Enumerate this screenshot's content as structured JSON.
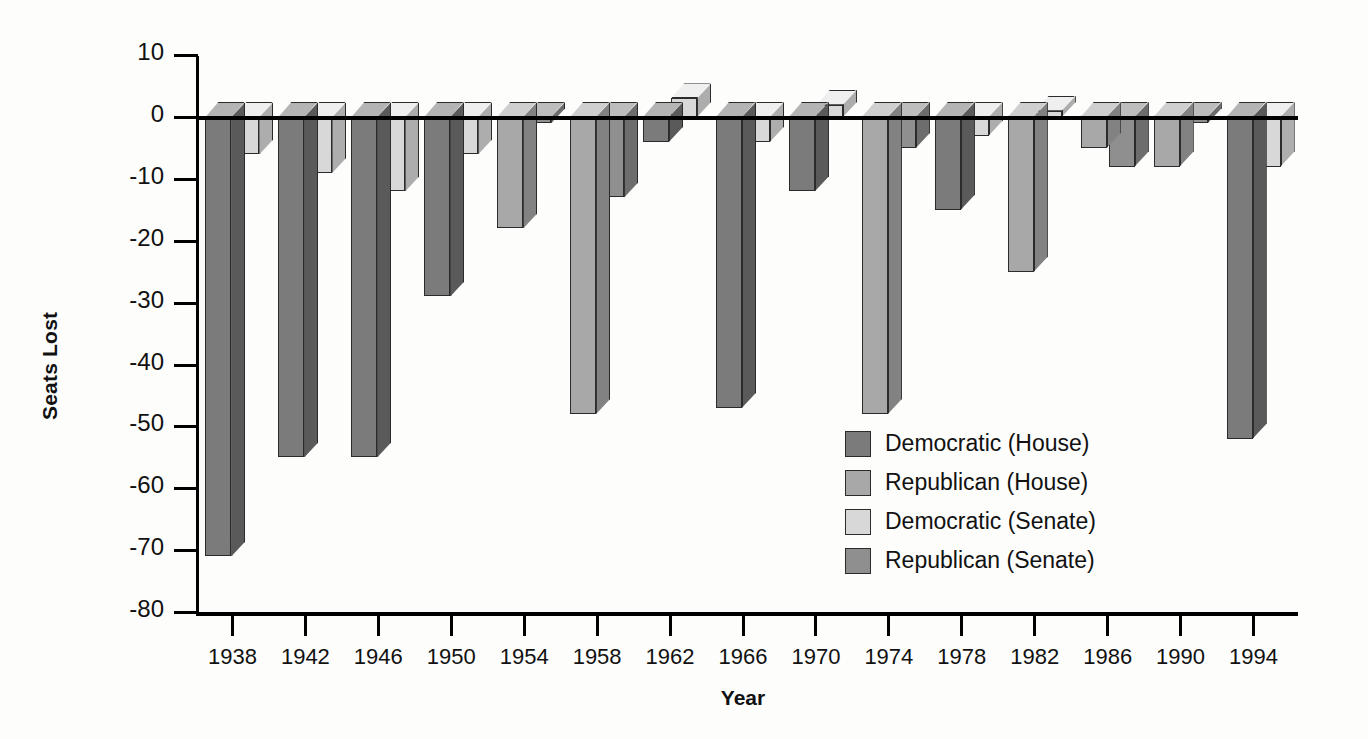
{
  "chart_data": {
    "type": "bar",
    "title": "",
    "subtitle": "",
    "xlabel": "Year",
    "ylabel": "Seats Lost",
    "grid": false,
    "legend_position": "inside-right",
    "ylim": [
      -80,
      10
    ],
    "ytick_step": 10,
    "yticks": [
      "10",
      "0",
      "-10",
      "-20",
      "-30",
      "-40",
      "-50",
      "-60",
      "-70",
      "-80"
    ],
    "ytick_values": [
      10,
      0,
      -10,
      -20,
      -30,
      -40,
      -50,
      -60,
      -70,
      -80
    ],
    "categories": [
      "1938",
      "1942",
      "1946",
      "1950",
      "1954",
      "1958",
      "1962",
      "1966",
      "1970",
      "1974",
      "1978",
      "1982",
      "1986",
      "1990",
      "1994"
    ],
    "series": [
      {
        "name": "Democratic (House)",
        "key": "dem_house",
        "color": "#7b7b7b",
        "top_color": "#b4b4b4",
        "side_color": "#5a5a5a",
        "values": [
          -71,
          -55,
          -55,
          -29,
          null,
          null,
          -4,
          -47,
          -12,
          null,
          -15,
          null,
          null,
          null,
          -52
        ]
      },
      {
        "name": "Republican (House)",
        "key": "rep_house",
        "color": "#a8a8a8",
        "top_color": "#cfcfcf",
        "side_color": "#828282",
        "values": [
          null,
          null,
          null,
          null,
          -18,
          -48,
          null,
          null,
          null,
          -48,
          null,
          -25,
          -5,
          -8,
          null
        ]
      },
      {
        "name": "Democratic (Senate)",
        "key": "dem_senate",
        "color": "#d8d8d8",
        "top_color": "#efefef",
        "side_color": "#adadad",
        "values": [
          -6,
          -9,
          -12,
          -6,
          null,
          null,
          3,
          -4,
          2,
          null,
          -3,
          1,
          null,
          null,
          -8
        ]
      },
      {
        "name": "Republican (Senate)",
        "key": "rep_senate",
        "color": "#8f8f8f",
        "top_color": "#bdbdbd",
        "side_color": "#6d6d6d",
        "values": [
          null,
          null,
          null,
          null,
          -1,
          -13,
          null,
          null,
          null,
          -5,
          null,
          null,
          -8,
          -1,
          null
        ]
      }
    ],
    "points": [
      {
        "year": "1938",
        "house_party": "Democratic",
        "house": -71,
        "senate_party": "Democratic",
        "senate": -6
      },
      {
        "year": "1942",
        "house_party": "Democratic",
        "house": -55,
        "senate_party": "Democratic",
        "senate": -9
      },
      {
        "year": "1946",
        "house_party": "Democratic",
        "house": -55,
        "senate_party": "Democratic",
        "senate": -12
      },
      {
        "year": "1950",
        "house_party": "Democratic",
        "house": -29,
        "senate_party": "Democratic",
        "senate": -6
      },
      {
        "year": "1954",
        "house_party": "Republican",
        "house": -18,
        "senate_party": "Republican",
        "senate": -1
      },
      {
        "year": "1958",
        "house_party": "Republican",
        "house": -48,
        "senate_party": "Republican",
        "senate": -13
      },
      {
        "year": "1962",
        "house_party": "Democratic",
        "house": -4,
        "senate_party": "Democratic",
        "senate": 3
      },
      {
        "year": "1966",
        "house_party": "Democratic",
        "house": -47,
        "senate_party": "Democratic",
        "senate": -4
      },
      {
        "year": "1970",
        "house_party": "Democratic",
        "house": -12,
        "senate_party": "Democratic",
        "senate": 2
      },
      {
        "year": "1974",
        "house_party": "Republican",
        "house": -48,
        "senate_party": "Republican",
        "senate": -5
      },
      {
        "year": "1978",
        "house_party": "Democratic",
        "house": -15,
        "senate_party": "Democratic",
        "senate": -3
      },
      {
        "year": "1982",
        "house_party": "Republican",
        "house": -25,
        "senate_party": "Democratic",
        "senate": 1
      },
      {
        "year": "1986",
        "house_party": "Republican",
        "house": -5,
        "senate_party": "Republican",
        "senate": -8
      },
      {
        "year": "1990",
        "house_party": "Republican",
        "house": -8,
        "senate_party": "Republican",
        "senate": -1
      },
      {
        "year": "1994",
        "house_party": "Democratic",
        "house": -52,
        "senate_party": "Democratic",
        "senate": -8
      }
    ]
  },
  "legend": {
    "items": [
      {
        "label": "Democratic (House)",
        "key": "dem_house"
      },
      {
        "label": "Republican (House)",
        "key": "rep_house"
      },
      {
        "label": "Democratic (Senate)",
        "key": "dem_senate"
      },
      {
        "label": "Republican (Senate)",
        "key": "rep_senate"
      }
    ]
  },
  "axes": {
    "y_title": "Seats Lost",
    "x_title": "Year"
  }
}
